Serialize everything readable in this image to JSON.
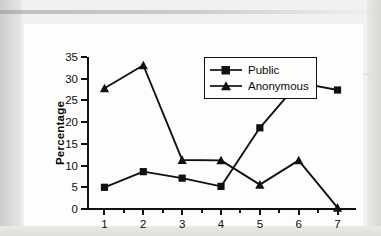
{
  "chart_data": {
    "type": "line",
    "title": "",
    "xlabel": "Measure of costs",
    "ylabel": "Percentage",
    "categories": [
      "1",
      "2",
      "3",
      "4",
      "5",
      "6",
      "7"
    ],
    "x": [
      1,
      2,
      3,
      4,
      5,
      6,
      7
    ],
    "xlim": [
      0.55,
      7.45
    ],
    "ylim": [
      0,
      35
    ],
    "yticks": [
      0,
      5,
      10,
      15,
      20,
      25,
      30,
      35
    ],
    "ytick_labels": [
      "0",
      "5",
      "10",
      "15",
      "20",
      "25",
      "30",
      "35"
    ],
    "xticks": [
      1,
      2,
      3,
      4,
      5,
      6,
      7
    ],
    "xtick_labels": [
      "1",
      "2",
      "3",
      "4",
      "5",
      "6",
      "7"
    ],
    "x_minor_ticks": [
      1.5,
      2.5,
      3.5,
      4.5,
      5.5,
      6.5
    ],
    "grid": false,
    "legend_position": "top-center",
    "series": [
      {
        "name": "Public",
        "marker": "square",
        "color": "#111111",
        "values": [
          5.0,
          8.6,
          7.1,
          5.2,
          18.7,
          29.1,
          27.4
        ]
      },
      {
        "name": "Anonymous",
        "marker": "triangle",
        "color": "#111111",
        "values": [
          27.8,
          33.1,
          11.3,
          11.2,
          5.6,
          11.2,
          0.3
        ]
      }
    ]
  },
  "legend": {
    "items": [
      {
        "label": "Public",
        "marker": "square-marker-icon"
      },
      {
        "label": "Anonymous",
        "marker": "triangle-marker-icon"
      }
    ]
  },
  "colors": {
    "ink": "#111111",
    "card_background": "#fdfdfc",
    "page_background": "#f2f1ef"
  }
}
